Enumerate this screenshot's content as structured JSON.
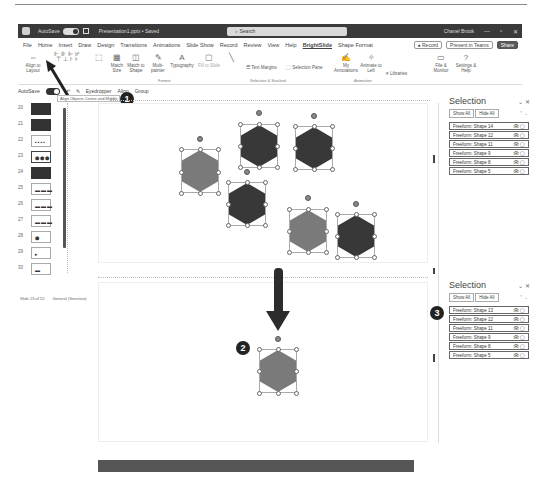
{
  "titlebar": {
    "autosave_label": "AutoSave",
    "autosave_state": "On",
    "filename": "Presentation1.pptx • Saved",
    "search_placeholder": "Search",
    "user": "Chanel Brook",
    "controls": [
      "—",
      "▫",
      "✕"
    ]
  },
  "menu": {
    "tabs": [
      "File",
      "Home",
      "Insert",
      "Draw",
      "Design",
      "Transitions",
      "Animations",
      "Slide Show",
      "Record",
      "Review",
      "View",
      "Help",
      "BrightSlide",
      "Shape Format"
    ],
    "active_tab": "BrightSlide",
    "record_label": "● Record",
    "present_label": "Present in Teams",
    "share_label": "Share"
  },
  "ribbon": {
    "items": [
      {
        "glyph": "⇔",
        "label": "Align to Layout"
      },
      {
        "glyph": "⬚",
        "label": ""
      },
      {
        "glyph": "▦",
        "label": "Match Size"
      },
      {
        "glyph": "◫",
        "label": "Match to Shape"
      },
      {
        "glyph": "✎",
        "label": "Multi-painter"
      },
      {
        "glyph": "A",
        "label": "Typography"
      },
      {
        "glyph": "▢",
        "label": "Fill to Slide"
      },
      {
        "glyph": "╲",
        "label": ""
      },
      {
        "glyph": "☰",
        "label": "Text Margins"
      },
      {
        "glyph": "⬚",
        "label": "Selection Pane"
      },
      {
        "glyph": "✍",
        "label": "My Annotations"
      },
      {
        "glyph": "✧",
        "label": "Animate to Left"
      },
      {
        "glyph": "≡",
        "label": "Libraries"
      },
      {
        "glyph": "▭",
        "label": "File & Monitor"
      },
      {
        "glyph": "?",
        "label": "Settings & Help"
      }
    ],
    "group_labels": [
      "Format",
      "Selection & Stacked",
      "Animation"
    ]
  },
  "quickbar": {
    "autosave_label": "AutoSave",
    "eyedropper_label": "Eyedropper",
    "align_label": "Align",
    "group_label": "Group"
  },
  "tooltip": "Align Objects Centre and Middle",
  "callouts": [
    "1",
    "2",
    "3"
  ],
  "thumbnails": [
    {
      "num": "20",
      "style": "dark",
      "content": ""
    },
    {
      "num": "21",
      "style": "dark",
      "content": ""
    },
    {
      "num": "22",
      "style": "light",
      "content": "▪▪▪▪"
    },
    {
      "num": "23",
      "style": "selected",
      "content": "⬢⬢⬢"
    },
    {
      "num": "24",
      "style": "dark",
      "content": ""
    },
    {
      "num": "25",
      "style": "light",
      "content": "▬▬▬"
    },
    {
      "num": "26",
      "style": "light",
      "content": "▬▬▬"
    },
    {
      "num": "27",
      "style": "light",
      "content": "▬▬▬"
    },
    {
      "num": "28",
      "style": "light",
      "content": "⬢"
    },
    {
      "num": "29",
      "style": "light",
      "content": "▸"
    },
    {
      "num": "30",
      "style": "light",
      "content": "▬"
    }
  ],
  "status": {
    "slide_info": "Slide 23 of 52",
    "accessibility": "General (Sensitive)"
  },
  "selection_pane_top": {
    "title": "Selection",
    "show_all": "Show All",
    "hide_all": "Hide All",
    "items": [
      "Freeform: Shape 14",
      "Freeform: Shape 12",
      "Freeform: Shape 11",
      "Freeform: Shape 9",
      "Freeform: Shape 8",
      "Freeform: Shape 5"
    ]
  },
  "selection_pane_bottom": {
    "title": "Selection",
    "show_all": "Show All",
    "hide_all": "Hide All",
    "items": [
      "Freeform: Shape 13",
      "Freeform: Shape 12",
      "Freeform: Shape 11",
      "Freeform: Shape 9",
      "Freeform: Shape 8",
      "Freeform: Shape 5"
    ]
  },
  "colors": {
    "hex_light": "#7a7a7a",
    "hex_dark": "#383838",
    "titlebar": "#3a3a3a"
  }
}
